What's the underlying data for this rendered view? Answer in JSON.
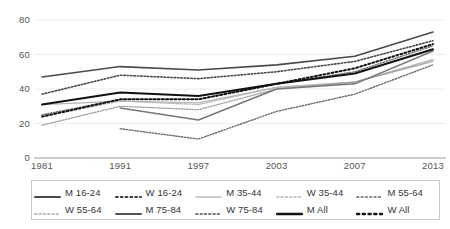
{
  "chart_data": {
    "type": "line",
    "title": "",
    "xlabel": "",
    "ylabel": "",
    "categories": [
      "1981",
      "1991",
      "1997",
      "2003",
      "2007",
      "2013"
    ],
    "ylim": [
      0,
      80
    ],
    "yticks": [
      "0",
      "20",
      "40",
      "60",
      "80"
    ],
    "grid": true,
    "legend_position": "bottom",
    "series": [
      {
        "name": "M 16-24",
        "style": "solid",
        "color": "#4a4a4a",
        "width": 1.6,
        "values": [
          47,
          53,
          51,
          54,
          59,
          73
        ]
      },
      {
        "name": "W 16-24",
        "style": "dotted",
        "color": "#4a4a4a",
        "width": 1.6,
        "values": [
          37,
          48,
          46,
          50,
          56,
          68
        ]
      },
      {
        "name": "M 35-44",
        "style": "solid",
        "color": "#b5b5b5",
        "width": 1.3,
        "values": [
          31,
          33,
          32,
          41,
          44,
          57
        ]
      },
      {
        "name": "W 35-44",
        "style": "dotted",
        "color": "#b5b5b5",
        "width": 1.3,
        "values": [
          24,
          33,
          31,
          41,
          44,
          57
        ]
      },
      {
        "name": "M 55-64",
        "style": "dotted",
        "color": "#6e6e6e",
        "width": 1.4,
        "values": [
          25,
          34,
          34,
          43,
          50,
          65
        ]
      },
      {
        "name": "W 55-64",
        "style": "dotted",
        "color": "#9a9a9a",
        "width": 1.3,
        "values": [
          19,
          30,
          28,
          40,
          44,
          56
        ]
      },
      {
        "name": "M 75-84",
        "style": "solid",
        "color": "#777777",
        "width": 1.5,
        "values": [
          null,
          29,
          22,
          40,
          43,
          62
        ]
      },
      {
        "name": "W 75-84",
        "style": "dotted",
        "color": "#6a6a6a",
        "width": 1.4,
        "values": [
          null,
          17,
          11,
          27,
          37,
          54
        ]
      },
      {
        "name": "M All",
        "style": "solid",
        "color": "#111111",
        "width": 2.0,
        "values": [
          31,
          38,
          36,
          43,
          49,
          63
        ]
      },
      {
        "name": "W All",
        "style": "dotted",
        "color": "#111111",
        "width": 2.0,
        "values": [
          24,
          34,
          34,
          43,
          52,
          66
        ]
      }
    ]
  },
  "axis": {
    "y_labels": [
      "80",
      "60",
      "40",
      "20",
      "0"
    ],
    "x_labels": [
      "1981",
      "1991",
      "1997",
      "2003",
      "2007",
      "2013"
    ]
  },
  "legend": {
    "rows": [
      [
        {
          "label": "M 16-24",
          "style": "solid",
          "color": "#4a4a4a",
          "width": 2.0
        },
        {
          "label": "W 16-24",
          "style": "dotted",
          "color": "#3a3a3a",
          "width": 2.0
        },
        {
          "label": "M 35-44",
          "style": "solid",
          "color": "#bdbdbd",
          "width": 1.6
        },
        {
          "label": "W 35-44",
          "style": "dotted",
          "color": "#c4c4c4",
          "width": 1.8
        },
        {
          "label": "M 55-64",
          "style": "dotted",
          "color": "#8a8a8a",
          "width": 1.8
        }
      ],
      [
        {
          "label": "W 55-64",
          "style": "dotted",
          "color": "#c0c0c0",
          "width": 1.8
        },
        {
          "label": "M 75-84",
          "style": "solid",
          "color": "#545454",
          "width": 2.0
        },
        {
          "label": "W 75-84",
          "style": "dotted",
          "color": "#777777",
          "width": 1.8
        },
        {
          "label": "M All",
          "style": "solid",
          "color": "#111111",
          "width": 2.4
        },
        {
          "label": "W All",
          "style": "dotted",
          "color": "#111111",
          "width": 2.4
        }
      ]
    ]
  }
}
